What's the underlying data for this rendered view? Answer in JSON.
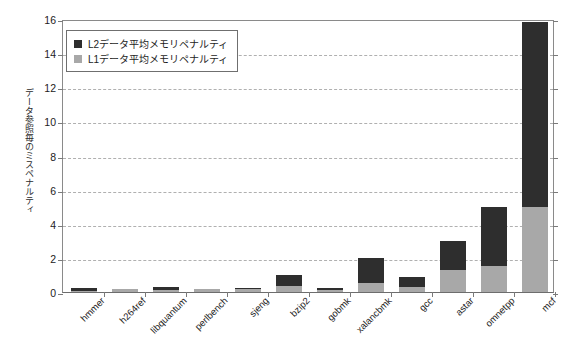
{
  "chart_data": {
    "type": "bar",
    "stacked": true,
    "title": "",
    "xlabel": "",
    "ylabel": "データ参照毎のミスペナルティ",
    "ylim": [
      0,
      16
    ],
    "ytick_step": 2,
    "yticks": [
      "16",
      "14",
      "12",
      "10",
      "8",
      "6",
      "4",
      "2",
      "0"
    ],
    "grid": true,
    "grid_axis": "y",
    "legend_position": "upper left",
    "categories": [
      "hmmer",
      "h264ref",
      "libquantum",
      "perlbench",
      "sjeng",
      "bzip2",
      "gobmk",
      "xalancbmk",
      "gcc",
      "astar",
      "omnetpp",
      "mcf"
    ],
    "series": [
      {
        "name": "L1データ平均メモリペナルティ",
        "color": "#a8a8a8",
        "values": [
          0.08,
          0.18,
          0.1,
          0.15,
          0.15,
          0.35,
          0.1,
          0.5,
          0.3,
          1.3,
          1.5,
          5.0
        ]
      },
      {
        "name": "L2データ平均メモリペナルティ",
        "color": "#2e2e2e",
        "values": [
          0.17,
          0.02,
          0.2,
          0.05,
          0.07,
          0.65,
          0.15,
          1.5,
          0.6,
          1.7,
          3.5,
          10.8
        ]
      }
    ],
    "totals": [
      0.25,
      0.2,
      0.3,
      0.2,
      0.22,
      1.0,
      0.25,
      2.0,
      0.9,
      3.0,
      5.0,
      15.8
    ]
  },
  "legend": {
    "items": [
      {
        "label": "L2データ平均メモリペナルティ",
        "color": "#2e2e2e"
      },
      {
        "label": "L1データ平均メモリペナルティ",
        "color": "#a8a8a8"
      }
    ]
  },
  "colors": {
    "l2": "#2e2e2e",
    "l1": "#a8a8a8",
    "axis": "#7a7a7a",
    "grid": "#b0b0b0",
    "background": "#ffffff"
  }
}
